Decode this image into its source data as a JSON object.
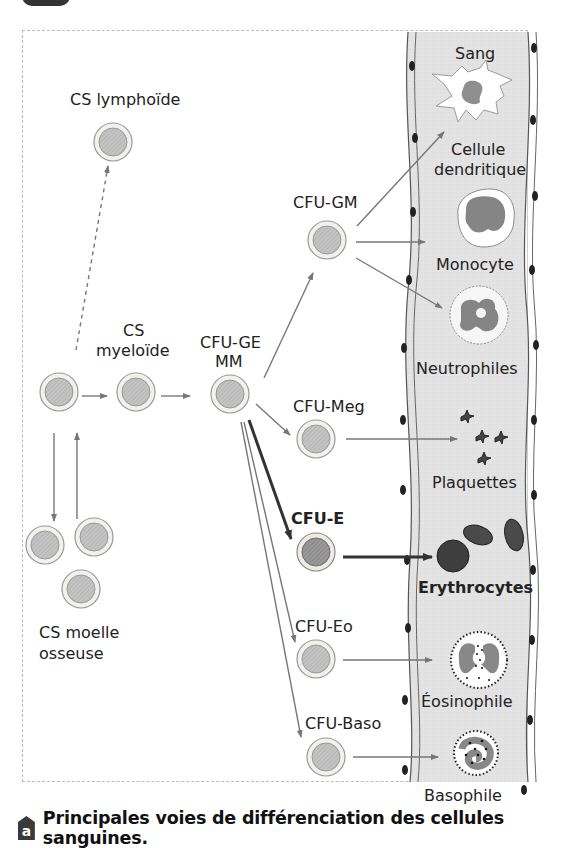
{
  "figure": {
    "caption_tag": "a",
    "caption": "Principales voies de différenciation des cellules sanguines.",
    "colors": {
      "vessel_fill": "#e6e6e6",
      "cell_outer": "#f0eeea",
      "cell_nucleus": "#bdbdbd",
      "arrow": "#7a7a7a",
      "arrow_strong": "#3a3a3a",
      "erythrocyte": "#4a4a4a"
    }
  },
  "stem_cells": {
    "lymphoid": "CS lymphoïde",
    "myeloid_line1": "CS",
    "myeloid_line2": "myeloïde",
    "marrow_line1": "CS moelle",
    "marrow_line2": "osseuse"
  },
  "progenitors": {
    "cfu_gemm_line1": "CFU-GE",
    "cfu_gemm_line2": "MM",
    "cfu_gm": "CFU-GM",
    "cfu_meg": "CFU-Meg",
    "cfu_e": "CFU-E",
    "cfu_eo": "CFU-Eo",
    "cfu_baso": "CFU-Baso"
  },
  "blood": {
    "vessel_label": "Sang",
    "dendritic_line1": "Cellule",
    "dendritic_line2": "dendritique",
    "monocyte": "Monocyte",
    "neutrophils": "Neutrophiles",
    "platelets": "Plaquettes",
    "erythrocytes": "Erythrocytes",
    "eosinophil": "Éosinophile",
    "basophil": "Basophile"
  }
}
